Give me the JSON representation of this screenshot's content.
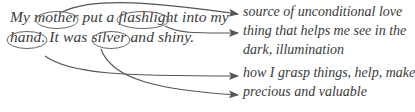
{
  "sentence": {
    "line1": {
      "w1": "My",
      "w2": "mother",
      "w3": "put a",
      "w4": "flashlight",
      "w5": "into my"
    },
    "line2": {
      "w1": "hand.",
      "w2": "It was",
      "w3": "silver",
      "w4": "and shiny."
    }
  },
  "circled_words": [
    "mother",
    "flashlight",
    "hand",
    "silver"
  ],
  "meanings": [
    {
      "word": "mother",
      "text": "source of unconditional love"
    },
    {
      "word": "flashlight",
      "text": "thing that helps me see in the",
      "continuation": "dark, illumination"
    },
    {
      "word": "hand",
      "text": "how I grasp things, help, make"
    },
    {
      "word": "silver",
      "text": "precious and valuable"
    }
  ],
  "colors": {
    "text": "#3a3a3a",
    "lines": "#555555",
    "background": "#ffffff"
  }
}
